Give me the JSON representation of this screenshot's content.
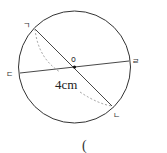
{
  "diagram": {
    "type": "circle-geometry",
    "center_label": "o",
    "points": {
      "top_left": "ㄱ",
      "bottom_right": "ㄴ",
      "left": "ㄷ",
      "right": "ㄹ"
    },
    "measurement": "4cm",
    "answer_paren": "(",
    "colors": {
      "stroke": "#333333",
      "dashed": "#888888"
    }
  }
}
